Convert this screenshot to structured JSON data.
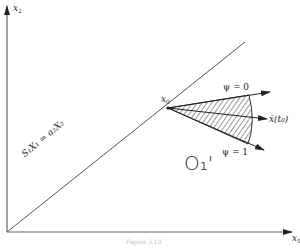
{
  "figure": {
    "axes": {
      "x_axis_label": "x",
      "x_axis_sub": "1",
      "y_axis_label": "x",
      "y_axis_sub": "2"
    },
    "point": {
      "label": "x",
      "sub": "0"
    },
    "boundary_line": {
      "label": "S₁X₁ = a₂X₂"
    },
    "rays": [
      {
        "id": "psi0",
        "label": "ψ = 0"
      },
      {
        "id": "xdot",
        "label": "ẋ(t₀)"
      },
      {
        "id": "psi1",
        "label": "ψ = 1"
      }
    ],
    "region": {
      "label": "O₁'"
    },
    "caption": "Figure 3.10"
  }
}
